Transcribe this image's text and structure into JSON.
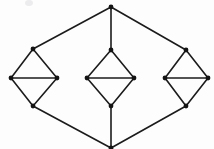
{
  "figure": {
    "background_color": "#fdfdfd",
    "edge_color": "#1b1b1b",
    "vertex_color": "#141414",
    "edge_width": 1.6,
    "vertex_radius": 2.4,
    "width": 214,
    "height": 149
  },
  "chart_data": {
    "type": "diagram",
    "title": "",
    "xlabel": "",
    "ylabel": "",
    "node_count": 14,
    "edge_count": 20,
    "nodes": [
      {
        "id": "top",
        "label": "",
        "x": 111,
        "y": 7
      },
      {
        "id": "bottom",
        "label": "",
        "x": 111,
        "y": 148
      },
      {
        "id": "l_top",
        "label": "",
        "x": 33,
        "y": 49
      },
      {
        "id": "l_left",
        "label": "",
        "x": 11,
        "y": 78
      },
      {
        "id": "l_right",
        "label": "",
        "x": 57,
        "y": 78
      },
      {
        "id": "l_bottom",
        "label": "",
        "x": 33,
        "y": 106
      },
      {
        "id": "m_top",
        "label": "",
        "x": 111,
        "y": 50
      },
      {
        "id": "m_left",
        "label": "",
        "x": 87,
        "y": 78
      },
      {
        "id": "m_right",
        "label": "",
        "x": 134,
        "y": 78
      },
      {
        "id": "m_bottom",
        "label": "",
        "x": 111,
        "y": 106
      },
      {
        "id": "r_top",
        "label": "",
        "x": 186,
        "y": 50
      },
      {
        "id": "r_left",
        "label": "",
        "x": 165,
        "y": 78
      },
      {
        "id": "r_right",
        "label": "",
        "x": 208,
        "y": 78
      },
      {
        "id": "r_bottom",
        "label": "",
        "x": 186,
        "y": 106
      }
    ],
    "edges": [
      {
        "from": "top",
        "to": "l_top"
      },
      {
        "from": "top",
        "to": "m_top"
      },
      {
        "from": "top",
        "to": "r_top"
      },
      {
        "from": "l_top",
        "to": "l_left"
      },
      {
        "from": "l_top",
        "to": "l_right"
      },
      {
        "from": "l_left",
        "to": "l_right"
      },
      {
        "from": "l_left",
        "to": "l_bottom"
      },
      {
        "from": "l_right",
        "to": "l_bottom"
      },
      {
        "from": "m_top",
        "to": "m_left"
      },
      {
        "from": "m_top",
        "to": "m_right"
      },
      {
        "from": "m_left",
        "to": "m_right"
      },
      {
        "from": "m_left",
        "to": "m_bottom"
      },
      {
        "from": "m_right",
        "to": "m_bottom"
      },
      {
        "from": "r_top",
        "to": "r_left"
      },
      {
        "from": "r_top",
        "to": "r_right"
      },
      {
        "from": "r_left",
        "to": "r_right"
      },
      {
        "from": "r_left",
        "to": "r_bottom"
      },
      {
        "from": "r_right",
        "to": "r_bottom"
      },
      {
        "from": "l_bottom",
        "to": "bottom"
      },
      {
        "from": "m_bottom",
        "to": "bottom"
      },
      {
        "from": "r_bottom",
        "to": "bottom"
      }
    ],
    "artifacts": [
      {
        "id": "scan-speck",
        "x": 29,
        "y": 3,
        "rx": 4,
        "ry": 3
      }
    ]
  }
}
